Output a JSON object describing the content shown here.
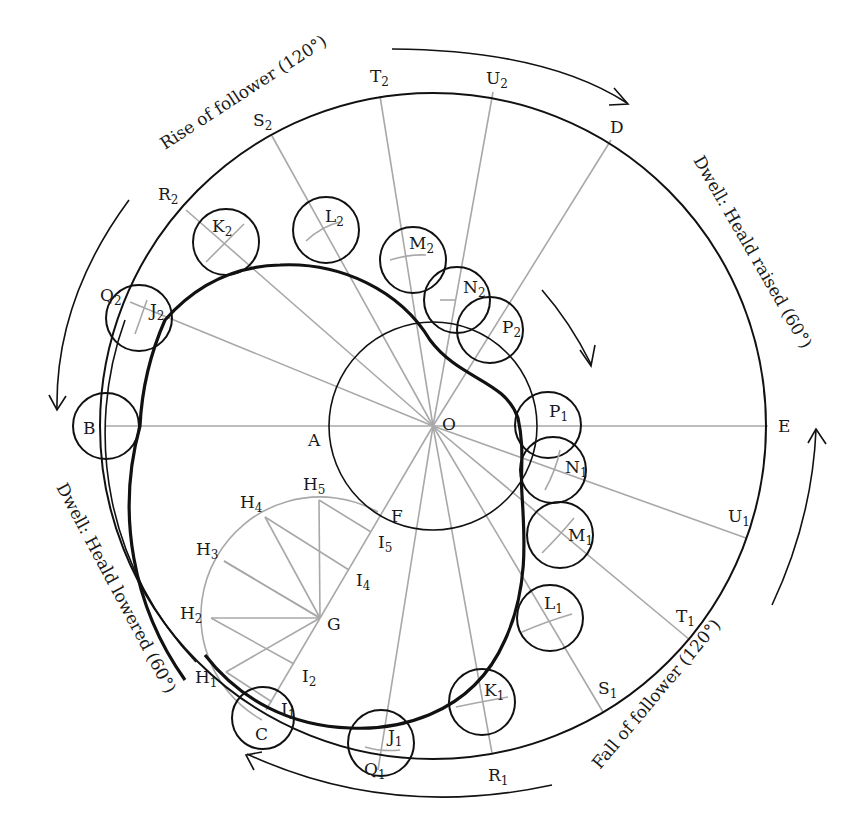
{
  "figure": {
    "type": "cam profile construction diagram",
    "center": {
      "name": "O",
      "x": 433,
      "y": 426
    },
    "outer_circle_radius": 333,
    "base_circle_radius": 104
  },
  "captions": {
    "rise": "Rise of follower (120°)",
    "dwell_raised": "Dwell: Heald raised (60°)",
    "fall": "Fall of follower (120°)",
    "dwell_lowered": "Dwell: Heald lowered (60°)"
  },
  "points": {
    "O": "O",
    "A": "A",
    "B": "B",
    "C": "C",
    "D": "D",
    "E": "E",
    "F": "F",
    "G": "G",
    "H1": {
      "base": "H",
      "sub": "1"
    },
    "H2": {
      "base": "H",
      "sub": "2"
    },
    "H3": {
      "base": "H",
      "sub": "3"
    },
    "H4": {
      "base": "H",
      "sub": "4"
    },
    "H5": {
      "base": "H",
      "sub": "5"
    },
    "I1": {
      "base": "I",
      "sub": "1"
    },
    "I2": {
      "base": "I",
      "sub": "2"
    },
    "I4": {
      "base": "I",
      "sub": "4"
    },
    "I5": {
      "base": "I",
      "sub": "5"
    },
    "J1": {
      "base": "J",
      "sub": "1"
    },
    "J2": {
      "base": "J",
      "sub": "2"
    },
    "K1": {
      "base": "K",
      "sub": "1"
    },
    "K2": {
      "base": "K",
      "sub": "2"
    },
    "L1": {
      "base": "L",
      "sub": "1"
    },
    "L2": {
      "base": "L",
      "sub": "2"
    },
    "M1": {
      "base": "M",
      "sub": "1"
    },
    "M2": {
      "base": "M",
      "sub": "2"
    },
    "N1": {
      "base": "N",
      "sub": "1"
    },
    "N2": {
      "base": "N",
      "sub": "2"
    },
    "P1": {
      "base": "P",
      "sub": "1"
    },
    "P2": {
      "base": "P",
      "sub": "2"
    },
    "Q1": {
      "base": "Q",
      "sub": "1"
    },
    "Q2": {
      "base": "Q",
      "sub": "2"
    },
    "R1": {
      "base": "R",
      "sub": "1"
    },
    "R2": {
      "base": "R",
      "sub": "2"
    },
    "S1": {
      "base": "S",
      "sub": "1"
    },
    "S2": {
      "base": "S",
      "sub": "2"
    },
    "T1": {
      "base": "T",
      "sub": "1"
    },
    "T2": {
      "base": "T",
      "sub": "2"
    },
    "U1": {
      "base": "U",
      "sub": "1"
    },
    "U2": {
      "base": "U",
      "sub": "2"
    }
  },
  "colors": {
    "ink": "#111111",
    "construction": "#a8a8a8",
    "background": "#ffffff"
  }
}
